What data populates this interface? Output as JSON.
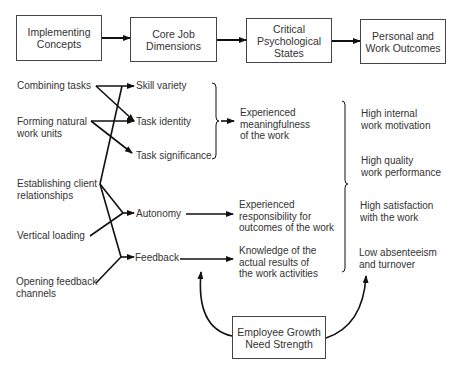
{
  "header_boxes": [
    {
      "label": "Implementing\nConcepts"
    },
    {
      "label": "Core Job\nDimensions"
    },
    {
      "label": "Critical\nPsychological\nStates"
    },
    {
      "label": "Personal and\nWork Outcomes"
    }
  ],
  "implementing_concepts": [
    {
      "label": "Combining tasks"
    },
    {
      "label": "Forming natural\nwork units"
    },
    {
      "label": "Establishing client\nrelationships"
    },
    {
      "label": "Vertical loading"
    },
    {
      "label": "Opening feedback\nchannels"
    }
  ],
  "core_dimensions": [
    {
      "label": "Skill variety"
    },
    {
      "label": "Task identity"
    },
    {
      "label": "Task significance"
    },
    {
      "label": "Autonomy"
    },
    {
      "label": "Feedback"
    }
  ],
  "psychological_states": [
    {
      "label": "Experienced\nmeaningfulness\nof the work"
    },
    {
      "label": "Experienced\nresponsibility for\noutcomes of the work"
    },
    {
      "label": "Knowledge of the\nactual results of\nthe work activities"
    }
  ],
  "outcomes": [
    {
      "label": "High internal\nwork motivation"
    },
    {
      "label": "High quality\nwork performance"
    },
    {
      "label": "High satisfaction\nwith the work"
    },
    {
      "label": "Low absenteeism\nand turnover"
    }
  ],
  "moderator": {
    "label": "Employee Growth\nNeed Strength"
  }
}
